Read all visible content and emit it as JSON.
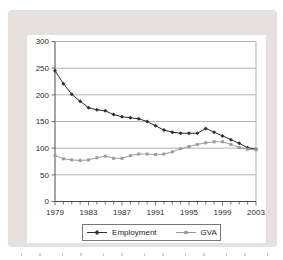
{
  "page": {
    "bg": "#ffffff",
    "panel_bg": "#e6e1de"
  },
  "chart_data": {
    "type": "line",
    "title": "",
    "xlabel": "",
    "ylabel": "",
    "years": [
      1979,
      1980,
      1981,
      1982,
      1983,
      1984,
      1985,
      1986,
      1987,
      1988,
      1989,
      1990,
      1991,
      1992,
      1993,
      1994,
      1995,
      1996,
      1997,
      1998,
      1999,
      2000,
      2001,
      2002,
      2003
    ],
    "series": [
      {
        "name": "Employment",
        "color": "#2f2f2f",
        "marker": "diamond",
        "values": [
          245,
          221,
          201,
          188,
          176,
          172,
          170,
          163,
          159,
          157,
          155,
          150,
          142,
          134,
          130,
          128,
          128,
          128,
          137,
          130,
          123,
          116,
          109,
          101,
          98
        ]
      },
      {
        "name": "GVA",
        "color": "#9b9b9b",
        "marker": "square",
        "values": [
          86,
          80,
          78,
          77,
          78,
          82,
          85,
          81,
          81,
          86,
          89,
          89,
          88,
          89,
          93,
          99,
          103,
          107,
          110,
          112,
          112,
          107,
          101,
          98,
          97
        ]
      }
    ],
    "ylim": [
      0,
      300
    ],
    "y_ticks": [
      0,
      50,
      100,
      150,
      200,
      250,
      300
    ],
    "x_tick_labels": [
      "1979",
      "1983",
      "1987",
      "1991",
      "1995",
      "1999",
      "2003"
    ],
    "x_label_step": 4,
    "grid": "horizontal",
    "legend_position": "bottom",
    "colors": {
      "gridline": "#9a9a9a",
      "axis": "#4a4a4a",
      "tick_text": "#2b2b2b"
    }
  }
}
